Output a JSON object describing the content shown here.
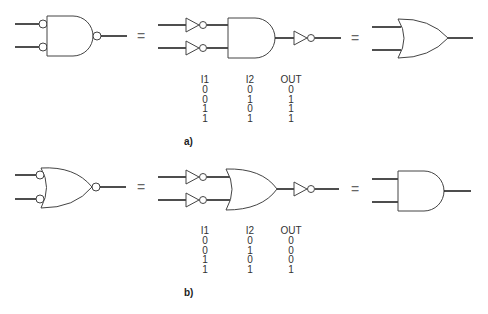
{
  "figure": {
    "panels": [
      {
        "id": "a",
        "label": "a)",
        "equals_sign": "=",
        "left_gate": "AND gate with inverted inputs and inverted output (negative-logic NAND)",
        "middle_circuit": "Two inverters feeding an AND gate followed by an inverter",
        "right_gate": "OR gate",
        "truth_table": {
          "headers": [
            "I1",
            "I2",
            "OUT"
          ],
          "rows": [
            [
              "0",
              "0",
              "0"
            ],
            [
              "0",
              "1",
              "1"
            ],
            [
              "1",
              "0",
              "1"
            ],
            [
              "1",
              "1",
              "1"
            ]
          ]
        }
      },
      {
        "id": "b",
        "label": "b)",
        "equals_sign": "=",
        "left_gate": "OR gate with inverted inputs and inverted output (negative-logic NOR)",
        "middle_circuit": "Two inverters feeding an OR gate followed by an inverter",
        "right_gate": "AND gate",
        "truth_table": {
          "headers": [
            "I1",
            "I2",
            "OUT"
          ],
          "rows": [
            [
              "0",
              "0",
              "0"
            ],
            [
              "0",
              "1",
              "0"
            ],
            [
              "1",
              "0",
              "0"
            ],
            [
              "1",
              "1",
              "1"
            ]
          ]
        }
      }
    ]
  }
}
